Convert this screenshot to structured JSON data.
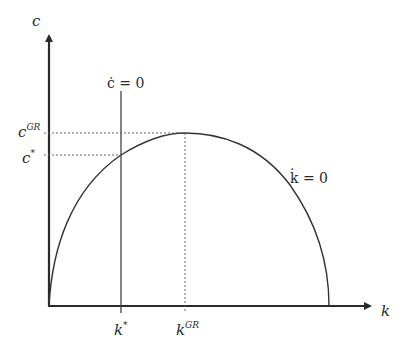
{
  "diagram": {
    "axes": {
      "y_label": "c",
      "x_label": "k"
    },
    "loci": {
      "c_dot_zero": {
        "label": "ċ = 0",
        "x_base": "k",
        "x_sup": "*"
      },
      "k_dot_zero": {
        "label": "k̇ = 0"
      }
    },
    "y_ticks": [
      {
        "base": "c",
        "sup": "GR"
      },
      {
        "base": "c",
        "sup": "*"
      }
    ],
    "x_ticks": [
      {
        "base": "k",
        "sup": "*"
      },
      {
        "base": "k",
        "sup": "GR"
      }
    ],
    "colors": {
      "axis": "#2a2a2a",
      "curve": "#333333",
      "guide": "#555555"
    }
  }
}
